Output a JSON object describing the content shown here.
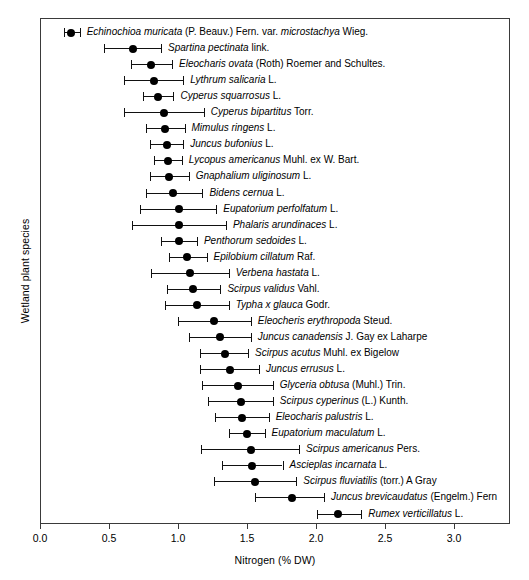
{
  "chart_data": {
    "type": "scatter",
    "title": "",
    "xlabel": "Nitrogen (% DW)",
    "ylabel": "Wetland plant species",
    "xlim": [
      0.0,
      3.4
    ],
    "ylim": [
      0,
      31
    ],
    "grid": false,
    "legend": null,
    "error_bars": "horizontal",
    "xticks": [
      "0.0",
      "0.5",
      "1.0",
      "1.5",
      "2.0",
      "2.5",
      "3.0"
    ],
    "xtick_values": [
      0.0,
      0.5,
      1.0,
      1.5,
      2.0,
      2.5,
      3.0
    ],
    "categories": [
      "Echinochioa muricata (P. Beauv.) Fern. var. microstachya Wieg.",
      "Spartina pectinata link.",
      "Eleocharis ovata (Roth) Roemer and Schultes.",
      "Lythrum salicaria L.",
      "Cyperus squarrosus L.",
      "Cyperus bipartitus Torr.",
      "Mimulus ringens L.",
      "Juncus bufonius L.",
      "Lycopus americanus Muhl. ex W. Bart.",
      "Gnaphalium uliginosum L.",
      "Bidens cernua L.",
      "Eupatorium perfolfatum L.",
      "Phalaris arundinaces L.",
      "Penthorum sedoides L.",
      "Epilobium cillatum Raf.",
      "Verbena hastata L.",
      "Scirpus validus Vahl.",
      "Typha x glauca Godr.",
      "Eleocheris erythropoda Steud.",
      "Juncus canadensis J. Gay ex Laharpe",
      "Scirpus acutus Muhl. ex Bigelow",
      "Juncus errusus L.",
      "Glyceria obtusa (Muhl.) Trin.",
      "Scirpus cyperinus (L.) Kunth.",
      "Eleocharis palustris L.",
      "Eupatorium maculatum L.",
      "Scirpus americanus Pers.",
      "Ascieplas incarnata L.",
      "Scirpus fluviatilis (torr.) A Gray",
      "Juncus brevicaudatus (Engelm.) Fern",
      "Rumex verticillatus L."
    ],
    "points": [
      {
        "label": "Echinochioa muricata (P. Beauv.) Fern. var. microstachya Wieg.",
        "label_plain": "Echinochioa muricata",
        "label_authority": " (P. Beauv.) Fern. var. ",
        "label_italic2": "microstachya",
        "label_tail": " Wieg.",
        "mean": 0.22,
        "low": 0.17,
        "high": 0.28
      },
      {
        "label": "Spartina pectinata link.",
        "label_plain": "Spartina pectinata",
        "label_tail": " link.",
        "mean": 0.67,
        "low": 0.46,
        "high": 0.87
      },
      {
        "label": "Eleocharis ovata (Roth) Roemer and Schultes.",
        "label_plain": "Eleocharis ovata",
        "label_tail": " (Roth) Roemer and Schultes.",
        "mean": 0.8,
        "low": 0.65,
        "high": 0.95
      },
      {
        "label": "Lythrum salicaria L.",
        "label_plain": "Lythrum salicaria",
        "label_tail": " L.",
        "mean": 0.82,
        "low": 0.6,
        "high": 1.03
      },
      {
        "label": "Cyperus squarrosus L.",
        "label_plain": "Cyperus squarrosus",
        "label_tail": " L.",
        "mean": 0.85,
        "low": 0.74,
        "high": 0.96
      },
      {
        "label": "Cyperus bipartitus Torr.",
        "label_plain": "Cyperus bipartitus",
        "label_tail": " Torr.",
        "mean": 0.89,
        "low": 0.6,
        "high": 1.18
      },
      {
        "label": "Mimulus ringens L.",
        "label_plain": "Mimulus ringens",
        "label_tail": " L.",
        "mean": 0.9,
        "low": 0.76,
        "high": 1.04
      },
      {
        "label": "Juncus bufonius L.",
        "label_plain": "Juncus bufonius",
        "label_tail": " L.",
        "mean": 0.91,
        "low": 0.79,
        "high": 1.03
      },
      {
        "label": "Lycopus americanus Muhl. ex W. Bart.",
        "label_plain": "Lycopus americanus",
        "label_tail": " Muhl. ex W. Bart.",
        "mean": 0.92,
        "low": 0.82,
        "high": 1.02
      },
      {
        "label": "Gnaphalium uliginosum L.",
        "label_plain": "Gnaphalium uliginosum",
        "label_tail": " L.",
        "mean": 0.93,
        "low": 0.79,
        "high": 1.07
      },
      {
        "label": "Bidens cernua L.",
        "label_plain": "Bidens cernua",
        "label_tail": " L.",
        "mean": 0.96,
        "low": 0.76,
        "high": 1.17
      },
      {
        "label": "Eupatorium perfolfatum L.",
        "label_plain": "Eupatorium perfolfatum",
        "label_tail": " L.",
        "mean": 1.0,
        "low": 0.72,
        "high": 1.27
      },
      {
        "label": "Phalaris arundinaces L.",
        "label_plain": "Phalaris arundinaces",
        "label_tail": " L.",
        "mean": 1.0,
        "low": 0.66,
        "high": 1.34
      },
      {
        "label": "Penthorum sedoides L.",
        "label_plain": "Penthorum sedoides",
        "label_tail": " L.",
        "mean": 1.0,
        "low": 0.87,
        "high": 1.13
      },
      {
        "label": "Epilobium cillatum Raf.",
        "label_plain": "Epilobium cillatum",
        "label_tail": " Raf.",
        "mean": 1.06,
        "low": 0.93,
        "high": 1.2
      },
      {
        "label": "Verbena hastata L.",
        "label_plain": "Verbena hastata",
        "label_tail": " L.",
        "mean": 1.08,
        "low": 0.8,
        "high": 1.36
      },
      {
        "label": "Scirpus validus Vahl.",
        "label_plain": "Scirpus validus",
        "label_tail": " Vahl.",
        "mean": 1.1,
        "low": 0.91,
        "high": 1.3
      },
      {
        "label": "Typha x glauca Godr.",
        "label_plain": "Typha x glauca",
        "label_tail": " Godr.",
        "mean": 1.13,
        "low": 0.9,
        "high": 1.36
      },
      {
        "label": "Eleocheris erythropoda Steud.",
        "label_plain": "Eleocheris erythropoda",
        "label_tail": " Steud.",
        "mean": 1.25,
        "low": 0.99,
        "high": 1.52
      },
      {
        "label": "Juncus canadensis J. Gay ex Laharpe",
        "label_plain": "Juncus canadensis",
        "label_tail": " J. Gay ex Laharpe",
        "mean": 1.3,
        "low": 1.07,
        "high": 1.52
      },
      {
        "label": "Scirpus acutus Muhl. ex Bigelow",
        "label_plain": "Scirpus acutus",
        "label_tail": " Muhl. ex Bigelow",
        "mean": 1.33,
        "low": 1.15,
        "high": 1.5
      },
      {
        "label": "Juncus errusus L.",
        "label_plain": "Juncus errusus",
        "label_tail": " L.",
        "mean": 1.37,
        "low": 1.15,
        "high": 1.58
      },
      {
        "label": "Glyceria obtusa (Muhl.) Trin.",
        "label_plain": "Glyceria obtusa",
        "label_tail": " (Muhl.) Trin.",
        "mean": 1.43,
        "low": 1.17,
        "high": 1.68
      },
      {
        "label": "Scirpus cyperinus (L.) Kunth.",
        "label_plain": "Scirpus cyperinus",
        "label_tail": " (L.) Kunth.",
        "mean": 1.45,
        "low": 1.21,
        "high": 1.68
      },
      {
        "label": "Eleocharis palustris L.",
        "label_plain": "Eleocharis palustris",
        "label_tail": " L.",
        "mean": 1.46,
        "low": 1.26,
        "high": 1.65
      },
      {
        "label": "Eupatorium maculatum L.",
        "label_plain": "Eupatorium maculatum",
        "label_tail": " L.",
        "mean": 1.49,
        "low": 1.36,
        "high": 1.62
      },
      {
        "label": "Scirpus americanus Pers.",
        "label_plain": "Scirpus americanus",
        "label_tail": " Pers.",
        "mean": 1.52,
        "low": 1.16,
        "high": 1.87
      },
      {
        "label": "Ascieplas incarnata L.",
        "label_plain": "Ascieplas incarnata",
        "label_tail": " L.",
        "mean": 1.53,
        "low": 1.31,
        "high": 1.75
      },
      {
        "label": "Scirpus fluviatilis (torr.) A Gray",
        "label_plain": "Scirpus fluviatilis",
        "label_tail": " (torr.) A Gray",
        "mean": 1.55,
        "low": 1.25,
        "high": 1.85
      },
      {
        "label": "Juncus brevicaudatus (Engelm.) Fern",
        "label_plain": "Juncus brevicaudatus",
        "label_tail": " (Engelm.) Fern",
        "mean": 1.82,
        "low": 1.55,
        "high": 2.05
      },
      {
        "label": "Rumex verticillatus L.",
        "label_plain": "Rumex verticillatus",
        "label_tail": " L.",
        "mean": 2.15,
        "low": 2.0,
        "high": 2.32
      }
    ]
  },
  "axis": {
    "x_label": "Nitrogen (% DW)",
    "y_label": "Wetland plant species"
  }
}
